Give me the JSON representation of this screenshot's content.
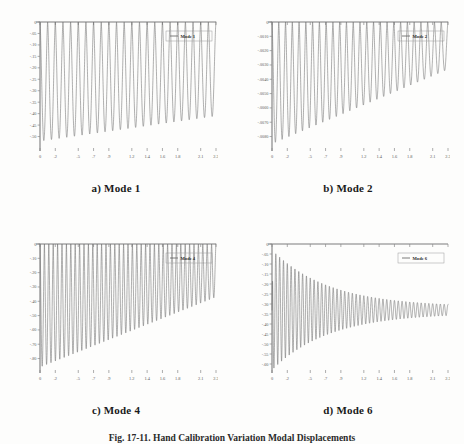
{
  "figure": {
    "caption": "Fig. 17-11.  Hand Calibration Variation  Modal Displacements",
    "background_color": "#fdfdfc",
    "curve_color": "#6e6e6e",
    "axis_color": "#7c7c7c"
  },
  "panels": [
    {
      "caption": "a) Mode 1",
      "legend": "Mode 1",
      "chart_data": {
        "type": "line",
        "title": "a) Mode 1",
        "legend_entries": [
          "Mode 1"
        ],
        "legend_position": "top-right",
        "grid": false,
        "xlabel": "",
        "ylabel": "",
        "xlim": [
          0,
          2.3
        ],
        "ylim": [
          -0.55,
          0
        ],
        "xticks": [
          "0",
          ".2",
          ".5",
          ".7",
          ".9",
          "1.2",
          "1.4",
          "1.6",
          "1.8",
          "2.1",
          "2.3"
        ],
        "xtick_values": [
          0,
          0.2,
          0.5,
          0.7,
          0.9,
          1.2,
          1.4,
          1.6,
          1.8,
          2.1,
          2.3
        ],
        "yticks": [
          "0",
          "-.05",
          "-.10",
          "-.15",
          "-.20",
          "-.25",
          "-.30",
          "-.35",
          "-.40",
          "-.45",
          "-.50"
        ],
        "ytick_values": [
          0,
          -0.05,
          -0.1,
          -0.15,
          -0.2,
          -0.25,
          -0.3,
          -0.35,
          -0.4,
          -0.45,
          -0.5
        ],
        "series": [
          {
            "name": "Mode 1",
            "waveform": "damped_rectified_oscillation",
            "cycles": 23,
            "envelope_start": -0.52,
            "envelope_end": -0.41,
            "baseline": 0
          }
        ]
      }
    },
    {
      "caption": "b) Mode 2",
      "legend": "Mode 2",
      "chart_data": {
        "type": "line",
        "title": "b) Mode 2",
        "legend_entries": [
          "Mode 2"
        ],
        "legend_position": "top-right",
        "grid": false,
        "xlabel": "",
        "ylabel": "",
        "xlim": [
          0,
          2.3
        ],
        "ylim": [
          -0.0088,
          0
        ],
        "xticks": [
          "0",
          ".2",
          ".5",
          ".7",
          ".9",
          "1.2",
          "1.4",
          "1.6",
          "1.8",
          "2.1",
          "2.3"
        ],
        "xtick_values": [
          0,
          0.2,
          0.5,
          0.7,
          0.9,
          1.2,
          1.4,
          1.6,
          1.8,
          2.1,
          2.3
        ],
        "yticks": [
          "0",
          "-.0010",
          "-.0020",
          "-.0030",
          "-.0040",
          "-.0050",
          "-.0060",
          "-.0070",
          "-.0080"
        ],
        "ytick_values": [
          0,
          -0.001,
          -0.002,
          -0.003,
          -0.004,
          -0.005,
          -0.006,
          -0.007,
          -0.008
        ],
        "series": [
          {
            "name": "Mode 2",
            "waveform": "damped_rectified_oscillation",
            "cycles": 26,
            "envelope_start": -0.0085,
            "envelope_end": -0.0033,
            "baseline": 0
          }
        ]
      }
    },
    {
      "caption": "c) Mode 4",
      "legend": "Mode 4",
      "chart_data": {
        "type": "line",
        "title": "c) Mode 4",
        "legend_entries": [
          "Mode 4"
        ],
        "legend_position": "top-right",
        "grid": false,
        "xlabel": "",
        "ylabel": "",
        "xlim": [
          0,
          2.3
        ],
        "ylim": [
          -0.88,
          0
        ],
        "xticks": [
          "0",
          ".2",
          ".5",
          ".7",
          ".9",
          "1.2",
          "1.4",
          "1.6",
          "1.8",
          "2.1",
          "2.3"
        ],
        "xtick_values": [
          0,
          0.2,
          0.5,
          0.7,
          0.9,
          1.2,
          1.4,
          1.6,
          1.8,
          2.1,
          2.3
        ],
        "yticks": [
          "0",
          "-.10",
          "-.20",
          "-.30",
          "-.40",
          "-.50",
          "-.60",
          "-.70",
          "-.80"
        ],
        "ytick_values": [
          0,
          -0.1,
          -0.2,
          -0.3,
          -0.4,
          -0.5,
          -0.6,
          -0.7,
          -0.8
        ],
        "series": [
          {
            "name": "Mode 4",
            "waveform": "damped_rectified_oscillation",
            "cycles": 40,
            "envelope_start": -0.86,
            "envelope_end": -0.37,
            "baseline": 0
          }
        ]
      }
    },
    {
      "caption": "d) Mode 6",
      "legend": "Mode 6",
      "chart_data": {
        "type": "line",
        "title": "d) Mode 6",
        "legend_entries": [
          "Mode 6"
        ],
        "legend_position": "top-right",
        "grid": false,
        "xlabel": "",
        "ylabel": "",
        "xlim": [
          0,
          2.3
        ],
        "ylim": [
          -0.63,
          0
        ],
        "xticks": [
          "0",
          ".2",
          ".5",
          ".7",
          ".9",
          "1.2",
          "1.4",
          "1.6",
          "1.8",
          "2.1",
          "2.3"
        ],
        "xtick_values": [
          0,
          0.2,
          0.5,
          0.7,
          0.9,
          1.2,
          1.4,
          1.6,
          1.8,
          2.1,
          2.3
        ],
        "yticks": [
          "0",
          "-.05",
          "-.10",
          "-.15",
          "-.20",
          "-.25",
          "-.30",
          "-.35",
          "-.40",
          "-.45",
          "-.50",
          "-.55",
          "-.60"
        ],
        "ytick_values": [
          0,
          -0.05,
          -0.1,
          -0.15,
          -0.2,
          -0.25,
          -0.3,
          -0.35,
          -0.4,
          -0.45,
          -0.5,
          -0.55,
          -0.6
        ],
        "series": [
          {
            "name": "Mode 6",
            "waveform": "damped_oscillation_to_steady_state",
            "cycles": 46,
            "amplitude_start": 0.3,
            "amplitude_end": 0.015,
            "steady_state": -0.33,
            "damping": 3.1
          }
        ]
      }
    }
  ]
}
